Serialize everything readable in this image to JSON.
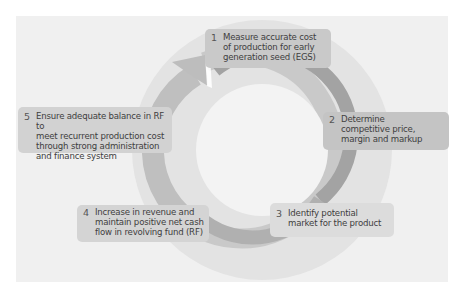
{
  "diagram": {
    "type": "cycle",
    "colors": {
      "page_background": "#ffffff",
      "panel_background": "#f0f0f0",
      "halo_circle": "#e2e2e2",
      "inner_circle": "#f2f2f2",
      "arrow_dark": "#9a9a9a",
      "arrow_mid": "#b4b4b4",
      "arrow_light": "#cacaca",
      "box_fill": "#cfcfcf",
      "text": "#3e3e3e"
    },
    "steps": [
      {
        "number": "1",
        "text": "Measure accurate cost\nof production for early\ngeneration seed (EGS)"
      },
      {
        "number": "2",
        "text": "Determine\ncompetitive price,\nmargin and markup"
      },
      {
        "number": "3",
        "text": "Identify potential\nmarket for the product"
      },
      {
        "number": "4",
        "text": "Increase in revenue and\nmaintain positive net cash\nflow in revolving fund (RF)"
      },
      {
        "number": "5",
        "text": "Ensure adequate balance in RF to\nmeet recurrent production cost\nthrough strong administration\nand finance system"
      }
    ]
  }
}
